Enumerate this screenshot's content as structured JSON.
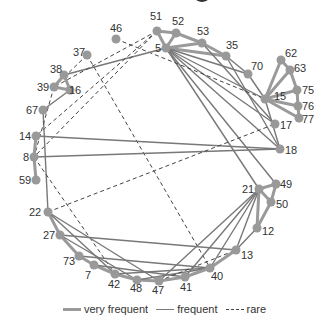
{
  "diagram": {
    "type": "circular network graph",
    "node_color": "#999999",
    "edge_colors": {
      "very_frequent": "#9a9a9a",
      "frequent": "#787878",
      "rare": "#444444"
    },
    "nodes": [
      {
        "id": "51",
        "x": 157,
        "y": 31,
        "lx": 150,
        "ly": 20,
        "anchor": "start"
      },
      {
        "id": "52",
        "x": 176,
        "y": 33,
        "lx": 172,
        "ly": 25,
        "anchor": "start"
      },
      {
        "id": "53",
        "x": 202,
        "y": 43,
        "lx": 197,
        "ly": 35,
        "anchor": "start"
      },
      {
        "id": "5",
        "x": 166,
        "y": 48,
        "lx": 155,
        "ly": 52,
        "anchor": "start"
      },
      {
        "id": "35",
        "x": 226,
        "y": 56,
        "lx": 226,
        "ly": 49,
        "anchor": "start"
      },
      {
        "id": "46",
        "x": 116,
        "y": 39,
        "lx": 110,
        "ly": 32,
        "anchor": "start"
      },
      {
        "id": "37",
        "x": 87,
        "y": 55,
        "lx": 73,
        "ly": 56,
        "anchor": "start"
      },
      {
        "id": "70",
        "x": 248,
        "y": 74,
        "lx": 251,
        "ly": 70,
        "anchor": "start"
      },
      {
        "id": "62",
        "x": 281,
        "y": 60,
        "lx": 285,
        "ly": 57,
        "anchor": "start"
      },
      {
        "id": "63",
        "x": 290,
        "y": 70,
        "lx": 294,
        "ly": 72,
        "anchor": "start"
      },
      {
        "id": "75",
        "x": 297,
        "y": 90,
        "lx": 302,
        "ly": 94,
        "anchor": "start"
      },
      {
        "id": "76",
        "x": 298,
        "y": 106,
        "lx": 302,
        "ly": 110,
        "anchor": "start"
      },
      {
        "id": "77",
        "x": 299,
        "y": 118,
        "lx": 302,
        "ly": 123,
        "anchor": "start"
      },
      {
        "id": "15",
        "x": 265,
        "y": 99,
        "lx": 274,
        "ly": 100,
        "anchor": "start"
      },
      {
        "id": "17",
        "x": 275,
        "y": 124,
        "lx": 280,
        "ly": 129,
        "anchor": "start"
      },
      {
        "id": "18",
        "x": 280,
        "y": 149,
        "lx": 285,
        "ly": 154,
        "anchor": "start"
      },
      {
        "id": "38",
        "x": 64,
        "y": 75,
        "lx": 50,
        "ly": 73,
        "anchor": "start"
      },
      {
        "id": "39",
        "x": 54,
        "y": 87,
        "lx": 37,
        "ly": 91,
        "anchor": "start"
      },
      {
        "id": "16",
        "x": 70,
        "y": 90,
        "lx": 69,
        "ly": 94,
        "anchor": "start"
      },
      {
        "id": "67",
        "x": 43,
        "y": 110,
        "lx": 26,
        "ly": 114,
        "anchor": "start"
      },
      {
        "id": "14",
        "x": 36,
        "y": 136,
        "lx": 19,
        "ly": 140,
        "anchor": "start"
      },
      {
        "id": "8",
        "x": 34,
        "y": 157,
        "lx": 23,
        "ly": 161,
        "anchor": "start"
      },
      {
        "id": "59",
        "x": 36,
        "y": 180,
        "lx": 19,
        "ly": 184,
        "anchor": "start"
      },
      {
        "id": "49",
        "x": 276,
        "y": 184,
        "lx": 280,
        "ly": 188,
        "anchor": "start"
      },
      {
        "id": "21",
        "x": 259,
        "y": 189,
        "lx": 242,
        "ly": 193,
        "anchor": "start"
      },
      {
        "id": "50",
        "x": 271,
        "y": 202,
        "lx": 276,
        "ly": 208,
        "anchor": "start"
      },
      {
        "id": "12",
        "x": 257,
        "y": 228,
        "lx": 262,
        "ly": 235,
        "anchor": "start"
      },
      {
        "id": "13",
        "x": 236,
        "y": 250,
        "lx": 241,
        "ly": 259,
        "anchor": "start"
      },
      {
        "id": "22",
        "x": 48,
        "y": 212,
        "lx": 29,
        "ly": 216,
        "anchor": "start"
      },
      {
        "id": "27",
        "x": 60,
        "y": 235,
        "lx": 43,
        "ly": 239,
        "anchor": "start"
      },
      {
        "id": "73",
        "x": 79,
        "y": 256,
        "lx": 63,
        "ly": 265,
        "anchor": "start"
      },
      {
        "id": "7",
        "x": 94,
        "y": 265,
        "lx": 85,
        "ly": 279,
        "anchor": "start"
      },
      {
        "id": "42",
        "x": 115,
        "y": 274,
        "lx": 108,
        "ly": 288,
        "anchor": "start"
      },
      {
        "id": "48",
        "x": 137,
        "y": 280,
        "lx": 130,
        "ly": 292,
        "anchor": "start"
      },
      {
        "id": "47",
        "x": 159,
        "y": 281,
        "lx": 152,
        "ly": 294,
        "anchor": "start"
      },
      {
        "id": "41",
        "x": 185,
        "y": 277,
        "lx": 180,
        "ly": 291,
        "anchor": "start"
      },
      {
        "id": "40",
        "x": 210,
        "y": 268,
        "lx": 211,
        "ly": 280,
        "anchor": "start"
      }
    ],
    "edges": [
      {
        "a": "51",
        "b": "52",
        "t": "vf"
      },
      {
        "a": "51",
        "b": "5",
        "t": "vf"
      },
      {
        "a": "52",
        "b": "5",
        "t": "vf"
      },
      {
        "a": "52",
        "b": "53",
        "t": "vf"
      },
      {
        "a": "53",
        "b": "35",
        "t": "vf"
      },
      {
        "a": "5",
        "b": "53",
        "t": "vf"
      },
      {
        "a": "5",
        "b": "35",
        "t": "vf"
      },
      {
        "a": "35",
        "b": "70",
        "t": "f"
      },
      {
        "a": "70",
        "b": "15",
        "t": "f"
      },
      {
        "a": "15",
        "b": "62",
        "t": "vf"
      },
      {
        "a": "62",
        "b": "63",
        "t": "vf"
      },
      {
        "a": "15",
        "b": "63",
        "t": "vf"
      },
      {
        "a": "63",
        "b": "75",
        "t": "vf"
      },
      {
        "a": "15",
        "b": "75",
        "t": "vf"
      },
      {
        "a": "75",
        "b": "76",
        "t": "vf"
      },
      {
        "a": "15",
        "b": "76",
        "t": "vf"
      },
      {
        "a": "76",
        "b": "77",
        "t": "vf"
      },
      {
        "a": "15",
        "b": "77",
        "t": "vf"
      },
      {
        "a": "5",
        "b": "70",
        "t": "f"
      },
      {
        "a": "5",
        "b": "15",
        "t": "f"
      },
      {
        "a": "5",
        "b": "17",
        "t": "f"
      },
      {
        "a": "5",
        "b": "18",
        "t": "f"
      },
      {
        "a": "5",
        "b": "21",
        "t": "f"
      },
      {
        "a": "5",
        "b": "49",
        "t": "f"
      },
      {
        "a": "53",
        "b": "17",
        "t": "f"
      },
      {
        "a": "35",
        "b": "18",
        "t": "f"
      },
      {
        "a": "15",
        "b": "18",
        "t": "f"
      },
      {
        "a": "46",
        "b": "15",
        "t": "r"
      },
      {
        "a": "5",
        "b": "38",
        "t": "f"
      },
      {
        "a": "37",
        "b": "40",
        "t": "r"
      },
      {
        "a": "37",
        "b": "39",
        "t": "r"
      },
      {
        "a": "38",
        "b": "39",
        "t": "vf"
      },
      {
        "a": "38",
        "b": "16",
        "t": "vf"
      },
      {
        "a": "39",
        "b": "16",
        "t": "vf"
      },
      {
        "a": "16",
        "b": "67",
        "t": "f"
      },
      {
        "a": "51",
        "b": "39",
        "t": "r"
      },
      {
        "a": "51",
        "b": "14",
        "t": "r"
      },
      {
        "a": "51",
        "b": "8",
        "t": "r"
      },
      {
        "a": "67",
        "b": "22",
        "t": "f"
      },
      {
        "a": "39",
        "b": "8",
        "t": "r"
      },
      {
        "a": "14",
        "b": "8",
        "t": "vf"
      },
      {
        "a": "8",
        "b": "59",
        "t": "vf"
      },
      {
        "a": "14",
        "b": "18",
        "t": "f"
      },
      {
        "a": "8",
        "b": "18",
        "t": "f"
      },
      {
        "a": "8",
        "b": "42",
        "t": "r"
      },
      {
        "a": "22",
        "b": "17",
        "t": "r"
      },
      {
        "a": "22",
        "b": "27",
        "t": "vf"
      },
      {
        "a": "22",
        "b": "42",
        "t": "f"
      },
      {
        "a": "22",
        "b": "47",
        "t": "f"
      },
      {
        "a": "27",
        "b": "73",
        "t": "vf"
      },
      {
        "a": "27",
        "b": "13",
        "t": "f"
      },
      {
        "a": "27",
        "b": "48",
        "t": "f"
      },
      {
        "a": "73",
        "b": "7",
        "t": "vf"
      },
      {
        "a": "73",
        "b": "40",
        "t": "f"
      },
      {
        "a": "7",
        "b": "42",
        "t": "vf"
      },
      {
        "a": "7",
        "b": "41",
        "t": "f"
      },
      {
        "a": "42",
        "b": "48",
        "t": "vf"
      },
      {
        "a": "42",
        "b": "40",
        "t": "f"
      },
      {
        "a": "48",
        "b": "47",
        "t": "vf"
      },
      {
        "a": "48",
        "b": "40",
        "t": "f"
      },
      {
        "a": "47",
        "b": "41",
        "t": "vf"
      },
      {
        "a": "47",
        "b": "13",
        "t": "r"
      },
      {
        "a": "41",
        "b": "40",
        "t": "vf"
      },
      {
        "a": "40",
        "b": "13",
        "t": "vf"
      },
      {
        "a": "13",
        "b": "12",
        "t": "f"
      },
      {
        "a": "21",
        "b": "49",
        "t": "vf"
      },
      {
        "a": "21",
        "b": "50",
        "t": "vf"
      },
      {
        "a": "49",
        "b": "50",
        "t": "vf"
      },
      {
        "a": "50",
        "b": "12",
        "t": "vf"
      },
      {
        "a": "21",
        "b": "12",
        "t": "vf"
      },
      {
        "a": "21",
        "b": "13",
        "t": "f"
      },
      {
        "a": "21",
        "b": "40",
        "t": "f"
      },
      {
        "a": "21",
        "b": "41",
        "t": "f"
      },
      {
        "a": "21",
        "b": "47",
        "t": "f"
      }
    ]
  },
  "legend": {
    "very_frequent": "very frequent",
    "frequent": "frequent",
    "rare": "rare"
  }
}
